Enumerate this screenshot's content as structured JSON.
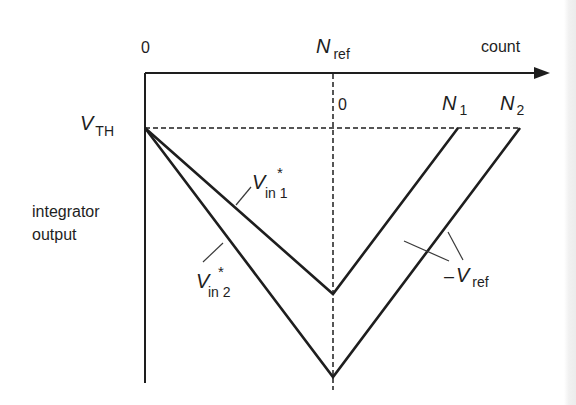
{
  "diagram": {
    "type": "dual-slope integrator timing diagram",
    "x_axis": {
      "label": "count",
      "origin_label": "0",
      "ref_label": {
        "main": "N",
        "sub": "ref"
      },
      "second_zero_label": "0"
    },
    "y_axis": {
      "label_line1": "integrator",
      "label_line2": "output",
      "threshold_label": {
        "main": "V",
        "sub": "TH"
      }
    },
    "end_labels": [
      {
        "main": "N",
        "sub": "1"
      },
      {
        "main": "N",
        "sub": "2"
      }
    ],
    "traces": [
      {
        "name": "V*in 1",
        "main": "V",
        "sup": "*",
        "sub": "in 1"
      },
      {
        "name": "V*in 2",
        "main": "V",
        "sup": "*",
        "sub": "in 2"
      }
    ],
    "slope_label": {
      "prefix": "–",
      "main": "V",
      "sub": "ref"
    }
  },
  "colors": {
    "ink": "#1e1e1e",
    "background": "#ffffff"
  }
}
